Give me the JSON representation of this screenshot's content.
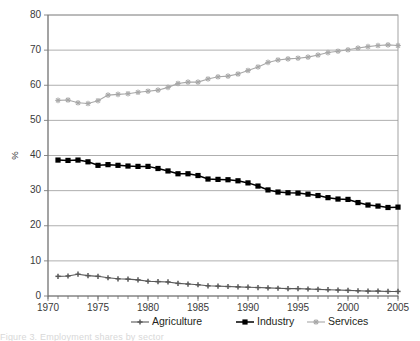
{
  "figure": {
    "ylabel": "%",
    "xlabel": "",
    "title": "",
    "caption_fragment": "Figure 3.  Employment shares by sector"
  },
  "legend": {
    "items": [
      {
        "label": "Agriculture",
        "marker": "cross-plus",
        "color": "#595959"
      },
      {
        "label": "Industry",
        "marker": "filled-square",
        "color": "#000000"
      },
      {
        "label": "Services",
        "marker": "star-asterisk",
        "color": "#a8a8a8"
      }
    ]
  },
  "chart_data": {
    "type": "line",
    "title": "",
    "xlabel": "",
    "ylabel": "%",
    "xlim": [
      1970,
      2005
    ],
    "ylim": [
      0,
      80
    ],
    "xticks": [
      1970,
      1975,
      1980,
      1985,
      1990,
      1995,
      2000,
      2005
    ],
    "yticks": [
      0,
      10,
      20,
      30,
      40,
      50,
      60,
      70,
      80
    ],
    "grid": "horizontal",
    "legend_position": "bottom",
    "x": [
      1971,
      1972,
      1973,
      1974,
      1975,
      1976,
      1977,
      1978,
      1979,
      1980,
      1981,
      1982,
      1983,
      1984,
      1985,
      1986,
      1987,
      1988,
      1989,
      1990,
      1991,
      1992,
      1993,
      1994,
      1995,
      1996,
      1997,
      1998,
      1999,
      2000,
      2001,
      2002,
      2003,
      2004,
      2005
    ],
    "series": [
      {
        "name": "Agriculture",
        "color": "#595959",
        "marker": "cross-plus",
        "values": [
          5.6,
          5.7,
          6.2,
          5.8,
          5.6,
          5.2,
          4.9,
          4.8,
          4.6,
          4.2,
          4.1,
          4.0,
          3.6,
          3.4,
          3.2,
          2.9,
          2.8,
          2.7,
          2.6,
          2.5,
          2.4,
          2.3,
          2.2,
          2.1,
          2.1,
          2.0,
          1.9,
          1.8,
          1.7,
          1.6,
          1.5,
          1.4,
          1.4,
          1.3,
          1.3
        ]
      },
      {
        "name": "Industry",
        "color": "#000000",
        "marker": "filled-square",
        "values": [
          38.7,
          38.6,
          38.7,
          38.2,
          37.2,
          37.4,
          37.2,
          37.0,
          36.9,
          36.9,
          36.3,
          35.6,
          34.8,
          34.8,
          34.3,
          33.3,
          33.2,
          33.1,
          32.8,
          32.2,
          31.3,
          30.2,
          29.6,
          29.4,
          29.3,
          29.0,
          28.6,
          28.0,
          27.6,
          27.5,
          26.6,
          25.9,
          25.6,
          25.2,
          25.3
        ]
      },
      {
        "name": "Services",
        "color": "#a8a8a8",
        "marker": "star-asterisk",
        "values": [
          55.7,
          55.8,
          55.0,
          54.8,
          55.6,
          57.2,
          57.4,
          57.6,
          58.0,
          58.3,
          58.6,
          59.4,
          60.5,
          60.9,
          60.9,
          61.8,
          62.4,
          62.6,
          63.2,
          64.2,
          65.2,
          66.5,
          67.2,
          67.5,
          67.7,
          68.0,
          68.6,
          69.3,
          69.7,
          70.1,
          70.6,
          71.0,
          71.3,
          71.5,
          71.3
        ]
      }
    ]
  }
}
